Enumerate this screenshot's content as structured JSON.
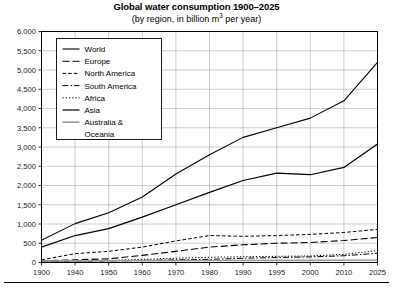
{
  "chart_data": {
    "type": "line",
    "title": "Global water consumption 1900–2025",
    "subtitle_prefix": "(by region, in billion m",
    "subtitle_sup": "3",
    "subtitle_suffix": " per year)",
    "xlabel": "",
    "ylabel": "",
    "ylim": [
      0,
      6000
    ],
    "ystep": 500,
    "grid": true,
    "legend_position": "upper-left",
    "categories": [
      "1900",
      "1940",
      "1950",
      "1960",
      "1970",
      "1980",
      "1990",
      "1995",
      "2000",
      "2010",
      "2025"
    ],
    "ytick_labels": [
      "0",
      "500",
      "1,000",
      "1,500",
      "2,000",
      "2,500",
      "3,000",
      "3,500",
      "4,000",
      "4,500",
      "5,000",
      "5,500",
      "6,000"
    ],
    "ytick_values": [
      0,
      500,
      1000,
      1500,
      2000,
      2500,
      3000,
      3500,
      4000,
      4500,
      5000,
      5500,
      6000
    ],
    "series": [
      {
        "name": "World",
        "style": "solid",
        "color": "#000000",
        "width": 1.1,
        "dash": "",
        "values": [
          580,
          1010,
          1290,
          1700,
          2300,
          2800,
          3250,
          3500,
          3750,
          4200,
          5200
        ]
      },
      {
        "name": "Europe",
        "style": "long-dash",
        "color": "#000000",
        "width": 1.1,
        "dash": "7,3",
        "values": [
          40,
          70,
          95,
          185,
          290,
          400,
          460,
          500,
          520,
          570,
          650
        ]
      },
      {
        "name": "North America",
        "style": "short-dash",
        "color": "#000000",
        "width": 1.0,
        "dash": "3.5,2.2",
        "values": [
          70,
          230,
          290,
          400,
          560,
          700,
          680,
          700,
          730,
          780,
          860
        ]
      },
      {
        "name": "South America",
        "style": "dash-dot",
        "color": "#000000",
        "width": 1.0,
        "dash": "6,2,1.5,2",
        "values": [
          15,
          30,
          40,
          55,
          70,
          80,
          110,
          130,
          145,
          175,
          240
        ]
      },
      {
        "name": "Africa",
        "style": "dotted",
        "color": "#000000",
        "width": 1.0,
        "dash": "1.3,1.9",
        "values": [
          20,
          45,
          55,
          80,
          110,
          135,
          150,
          160,
          170,
          210,
          310
        ]
      },
      {
        "name": "Asia",
        "style": "solid",
        "color": "#000000",
        "width": 1.2,
        "dash": "",
        "values": [
          400,
          700,
          880,
          1180,
          1500,
          1820,
          2130,
          2320,
          2280,
          2470,
          3080
        ]
      },
      {
        "name": "Australia & Oceania",
        "style": "solid",
        "color": "#9a9a9a",
        "width": 1.6,
        "dash": "",
        "values": [
          40,
          42,
          44,
          46,
          48,
          50,
          52,
          54,
          56,
          58,
          60
        ]
      }
    ],
    "legend_entries": [
      {
        "label": "World"
      },
      {
        "label": "Europe"
      },
      {
        "label": "North America"
      },
      {
        "label": "South America"
      },
      {
        "label": "Africa"
      },
      {
        "label": "Asia"
      },
      {
        "label": "Australia &"
      },
      {
        "label": "Oceania"
      }
    ]
  }
}
